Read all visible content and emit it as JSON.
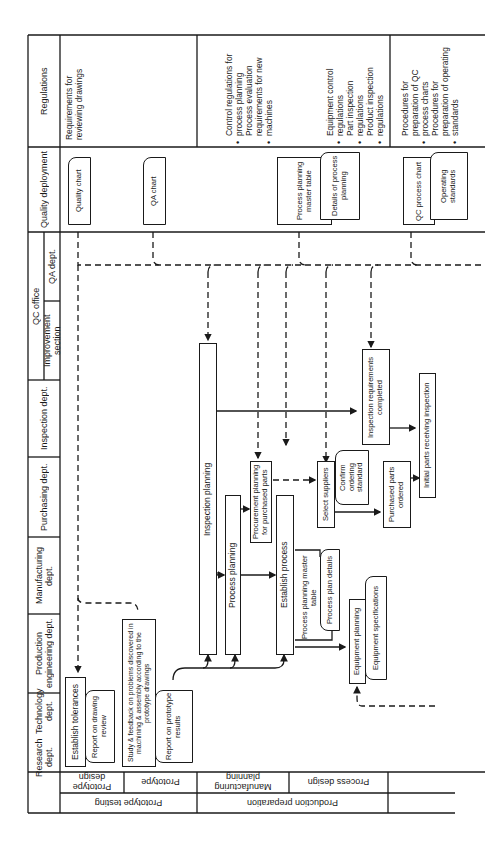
{
  "columns": {
    "research": {
      "line1": "Research dept.",
      "line2": "Technology dept."
    },
    "production_engineering": "Production engineering dept.",
    "manufacturing": "Manufacturing dept.",
    "purchasing": "Purchasing dept.",
    "inspection": "Inspection dept.",
    "qc_office": {
      "title": "QC office",
      "improvement_section": "Improvement section",
      "qa_dept": "QA dept."
    },
    "quality_deployment": "Quality deployment",
    "regulations": "Regulations"
  },
  "phases": {
    "prototype_testing": {
      "label": "Prototype testing",
      "steps": [
        "Prototype design",
        "Prototype"
      ]
    },
    "production_preparation": {
      "label": "Production preparation",
      "steps": [
        "Manufacturing planning",
        "Process design"
      ]
    }
  },
  "nodes": {
    "establish_tolerances": "Establish tolerances",
    "report_drawing_review": "Report on drawing review",
    "study_feedback": "Study & feedback on problems discovered in machining & assembly according to the prototype drawings",
    "report_prototype_results": "Report on prototype results",
    "inspection_planning": "Inspection planning",
    "process_planning": "Process planning",
    "procurement_planning": "Procurement planning for purchased parts",
    "establish_process": "Establish process",
    "process_planning_master_table": "Process planning master table",
    "process_plan_details": "Process plan details",
    "select_suppliers": "Select suppliers",
    "confirm_ordering_standard": "Confirm ordering standard",
    "purchased_parts_ordered": "Purchased parts ordered",
    "inspection_requirements_completed": "Inspection requirements completed",
    "initial_parts_receiving_inspection": "Initial parts receiving inspection",
    "equipment_planning": "Equipment planning",
    "equipment_specifications": "Equipment specifications"
  },
  "quality_deployment_docs": {
    "quality_chart": "Quality chart",
    "qa_chart": "QA chart",
    "process_planning_master_table": "Process planning master table",
    "details_of_process_planning": "Details of process planning",
    "qc_process_chart": "QC process chart",
    "operating_standards": "Operating standards"
  },
  "regulations": {
    "prototype": [
      "Requirements for reviewing drawings"
    ],
    "manufacturing_planning": [
      "Control regulations for process planning",
      "Process evaluation requirements for new machines"
    ],
    "process_design_a": [
      "Equipment control regulations",
      "Part inspection regulations",
      "Product inspection regulations"
    ],
    "process_design_b": [
      "Procedures for preparation of QC process charts",
      "Procedures for preparation of operating standards"
    ]
  }
}
